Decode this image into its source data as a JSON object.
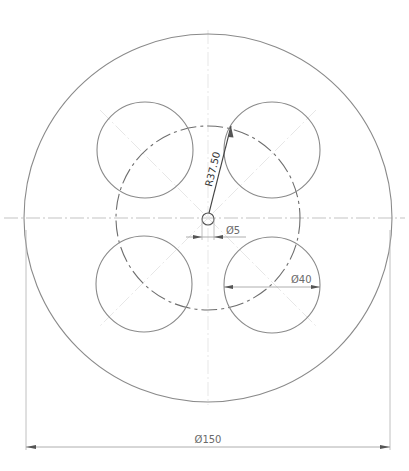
{
  "drawing": {
    "type": "engineering-drawing",
    "view": "front view of circular plate with four holes on pitch circle",
    "colors": {
      "geometry": "#8a8a8a",
      "centerline": "#b4b4b4",
      "dimension": "#9a9a9a",
      "text": "#6a6a6a"
    },
    "outer_circle": {
      "cx": 208,
      "cy": 218,
      "r": 184
    },
    "pitch_circle": {
      "cx": 208,
      "cy": 218,
      "r": 92
    },
    "center_hole": {
      "cx": 208,
      "cy": 219,
      "r": 6
    },
    "holes": [
      {
        "name": "top-left",
        "cx": 145,
        "cy": 150,
        "r": 48
      },
      {
        "name": "top-right",
        "cx": 272,
        "cy": 150,
        "r": 48
      },
      {
        "name": "bottom-left",
        "cx": 144,
        "cy": 284,
        "r": 48
      },
      {
        "name": "bottom-right",
        "cx": 272,
        "cy": 285,
        "r": 48
      }
    ],
    "dimensions": {
      "outer_diameter": {
        "label": "Ø150",
        "value": 150
      },
      "pitch_radius": {
        "label": "R37.50",
        "value": 37.5
      },
      "center_hole_diameter": {
        "label": "Ø5",
        "value": 5
      },
      "hole_diameter": {
        "label": "Ø40",
        "value": 40
      }
    }
  }
}
